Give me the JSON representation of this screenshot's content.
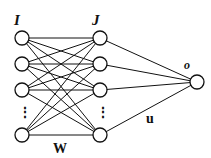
{
  "diagram": {
    "labels": {
      "input_layer": "I",
      "hidden_layer": "J",
      "output": "o",
      "weights_input_hidden": "W",
      "weights_hidden_output": "u"
    },
    "ellipsis": "⋮",
    "colors": {
      "stroke": "#111111",
      "node_fill": "#ffffff"
    },
    "layers": {
      "input": {
        "x": 22,
        "rows": [
          38,
          64,
          90,
          135
        ]
      },
      "hidden": {
        "x": 100,
        "rows": [
          38,
          64,
          90,
          135
        ]
      },
      "output": {
        "x": 197,
        "y": 82
      }
    },
    "node_radius": 7
  }
}
